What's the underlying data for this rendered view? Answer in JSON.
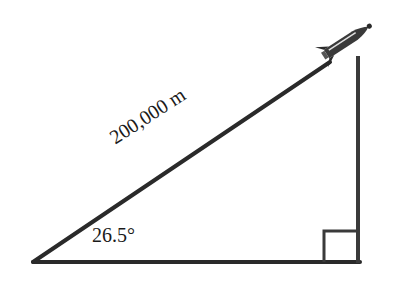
{
  "diagram": {
    "type": "right-triangle",
    "hypotenuse_label": "200,000 m",
    "angle_label": "26.5°",
    "right_angle_marker": true,
    "object_icon": "rocket-icon",
    "colors": {
      "line": "#2a2a2a",
      "background": "#ffffff"
    }
  }
}
